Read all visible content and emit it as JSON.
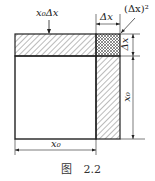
{
  "figure": {
    "caption_prefix": "图",
    "caption_number": "2.2",
    "labels": {
      "top_strip": "x₀Δx",
      "top_dim": "Δx",
      "corner": "(Δx)²",
      "right_small_dim": "Δx",
      "right_large_dim": "x₀",
      "bottom_dim": "x₀"
    },
    "colors": {
      "stroke": "#222222",
      "hatch": "#444444",
      "background": "#ffffff"
    }
  }
}
